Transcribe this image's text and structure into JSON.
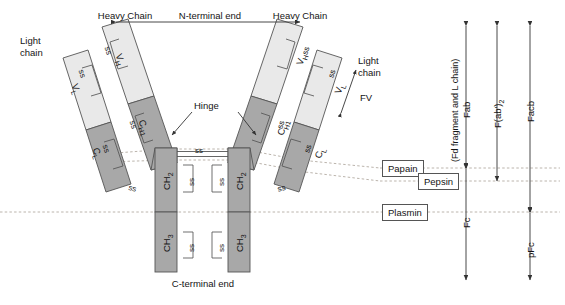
{
  "diagram": {
    "type": "schematic",
    "colors": {
      "variable_domain_fill": "#e9e9e9",
      "constant_domain_fill": "#a8a8a8",
      "outline": "#555555",
      "dashed_line": "#b0a8a0",
      "text": "#141414",
      "background": "#ffffff"
    }
  },
  "top_labels": {
    "heavy_chain_left": "Heavy Chain",
    "n_terminal": "N-terminal end",
    "heavy_chain_right": "Heavy Chain"
  },
  "side_labels": {
    "light_chain_left": "Light\nchain",
    "light_chain_left_line1": "Light",
    "light_chain_left_line2": "chain",
    "light_chain_right_line1": "Light",
    "light_chain_right_line2": "chain",
    "fv": "FV",
    "hinge": "Hinge"
  },
  "bottom_label": {
    "c_terminal": "C-terminal end"
  },
  "domains": {
    "light_chain": [
      {
        "name": "V_L",
        "label": "V",
        "sub": "L",
        "region": "variable"
      },
      {
        "name": "C_L",
        "label": "C",
        "sub": "L",
        "region": "constant"
      }
    ],
    "heavy_chain": [
      {
        "name": "V_H",
        "label": "V",
        "sub": "H",
        "region": "variable"
      },
      {
        "name": "C_H1",
        "label": "C",
        "sub": "H1",
        "region": "constant"
      },
      {
        "name": "C_H2",
        "label": "CH",
        "sub": "2",
        "region": "constant"
      },
      {
        "name": "C_H3",
        "label": "CH",
        "sub": "3",
        "region": "constant"
      }
    ]
  },
  "disulfide_label": "ss",
  "disulfide_count": 13,
  "enzymes": [
    {
      "name": "Papain",
      "label": "Papain",
      "cleaves": "above hinge disulfides"
    },
    {
      "name": "Pepsin",
      "label": "Pepsin",
      "cleaves": "below hinge disulfides"
    },
    {
      "name": "Plasmin",
      "label": "Plasmin",
      "cleaves": "between CH2 and CH3"
    }
  ],
  "fragment_brackets": [
    {
      "id": "fab",
      "label": "Fab",
      "sublabel": "(Fd fragment and L chain)",
      "span": "N-terminal end to papain site"
    },
    {
      "id": "fab2",
      "label": "F(ab')",
      "sub": "2",
      "span": "N-terminal end to pepsin site"
    },
    {
      "id": "facb",
      "label": "Facb",
      "span": "N-terminal end to plasmin site"
    },
    {
      "id": "fc",
      "label": "Fc",
      "span": "papain site to C-terminal end"
    },
    {
      "id": "pfc",
      "label": "pFc",
      "span": "plasmin site to C-terminal end"
    }
  ]
}
